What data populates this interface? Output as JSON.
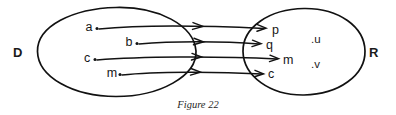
{
  "figure": {
    "caption": "Figure 22",
    "background_color": "#ffffff",
    "ink_color": "#111111",
    "width": 396,
    "height": 115
  },
  "domain_set": {
    "label": "D",
    "label_name": "domain-set-label",
    "elements": [
      {
        "label": "a",
        "x": 97,
        "y": 27
      },
      {
        "label": "b",
        "x": 137,
        "y": 42
      },
      {
        "label": "c",
        "x": 95,
        "y": 58
      },
      {
        "label": "m",
        "x": 120,
        "y": 73
      }
    ]
  },
  "range_set": {
    "label": "R",
    "label_name": "range-set-label",
    "elements": [
      {
        "label": "p",
        "x": 272,
        "y": 31
      },
      {
        "label": "q",
        "x": 266,
        "y": 46
      },
      {
        "label": "m",
        "x": 285,
        "y": 61
      },
      {
        "label": "c",
        "x": 270,
        "y": 75
      }
    ],
    "isolated_elements": [
      {
        "label": ".u",
        "x": 316,
        "y": 40
      },
      {
        "label": ".v",
        "x": 316,
        "y": 65
      }
    ]
  },
  "mappings": [
    {
      "from": "a",
      "to": "p"
    },
    {
      "from": "b",
      "to": "q"
    },
    {
      "from": "c",
      "to": "m"
    },
    {
      "from": "m",
      "to": "c"
    }
  ]
}
